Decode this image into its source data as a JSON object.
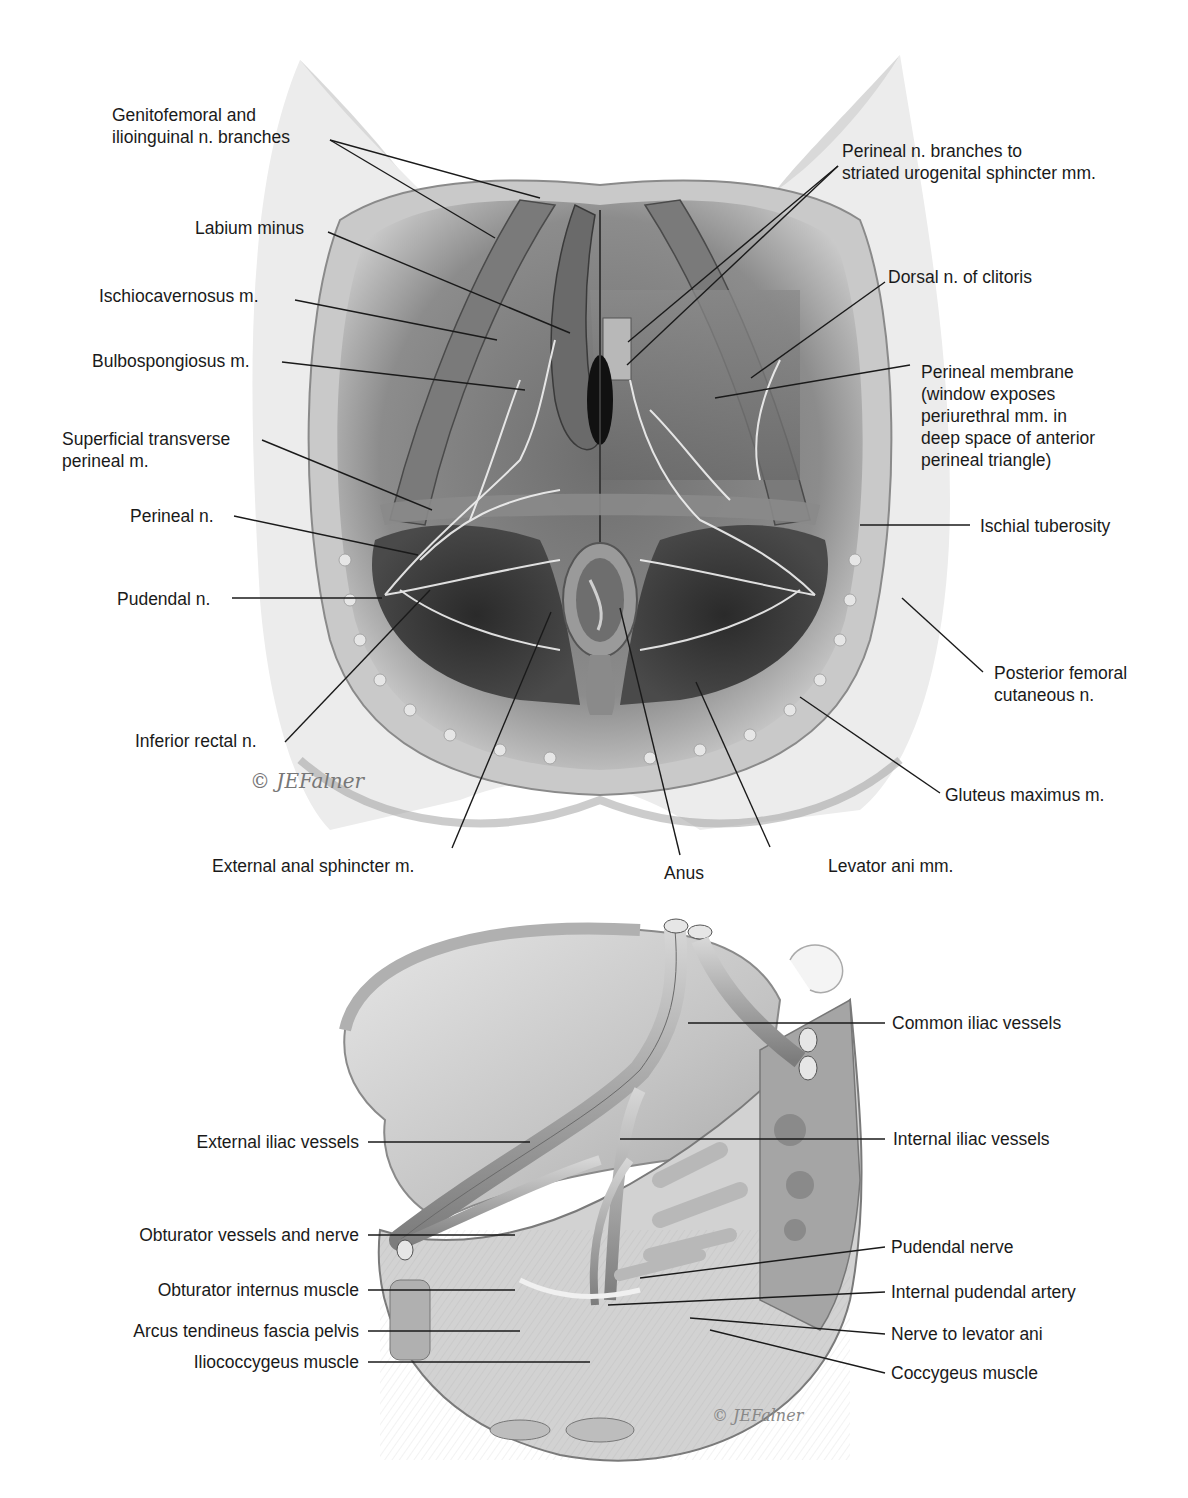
{
  "figure_top": {
    "title": "Female perineum — superficial dissection showing pudendal nerve branches",
    "labels_left": [
      {
        "id": "genitofemoral",
        "text": "Genitofemoral and\nilioinguinal n. branches"
      },
      {
        "id": "labium-minus",
        "text": "Labium minus"
      },
      {
        "id": "ischiocavernosus",
        "text": "Ischiocavernosus m."
      },
      {
        "id": "bulbospongiosus",
        "text": "Bulbospongiosus m."
      },
      {
        "id": "superficial-transverse",
        "text": "Superficial transverse\nperineal m."
      },
      {
        "id": "perineal-n",
        "text": "Perineal n."
      },
      {
        "id": "pudendal-n",
        "text": "Pudendal n."
      },
      {
        "id": "inferior-rectal",
        "text": "Inferior rectal n."
      }
    ],
    "labels_right": [
      {
        "id": "perineal-branches",
        "text": "Perineal n. branches to\nstriated urogenital sphincter mm."
      },
      {
        "id": "dorsal-n-clitoris",
        "text": "Dorsal n. of clitoris"
      },
      {
        "id": "perineal-membrane",
        "text": "Perineal membrane\n(window exposes\nperiurethral mm. in\ndeep space of anterior\nperineal triangle)"
      },
      {
        "id": "ischial-tuberosity",
        "text": "Ischial tuberosity"
      },
      {
        "id": "posterior-femoral",
        "text": "Posterior femoral\ncutaneous n."
      },
      {
        "id": "gluteus-maximus",
        "text": "Gluteus maximus m."
      }
    ],
    "labels_bottom": [
      {
        "id": "external-anal-sphincter",
        "text": "External anal sphincter m."
      },
      {
        "id": "anus",
        "text": "Anus"
      },
      {
        "id": "levator-ani",
        "text": "Levator ani mm."
      }
    ],
    "signature": "© JEFalner"
  },
  "figure_bottom": {
    "title": "Pelvic sidewall — medial view of iliac vessels and pudendal nerve",
    "labels_left": [
      {
        "id": "external-iliac",
        "text": "External iliac vessels"
      },
      {
        "id": "obturator-vessels",
        "text": "Obturator vessels and nerve"
      },
      {
        "id": "obturator-internus",
        "text": "Obturator internus muscle"
      },
      {
        "id": "arcus-tendineus",
        "text": "Arcus tendineus fascia pelvis"
      },
      {
        "id": "iliococcygeus",
        "text": "Iliococcygeus muscle"
      }
    ],
    "labels_right": [
      {
        "id": "common-iliac",
        "text": "Common iliac vessels"
      },
      {
        "id": "internal-iliac",
        "text": "Internal iliac vessels"
      },
      {
        "id": "pudendal-nerve",
        "text": "Pudendal nerve"
      },
      {
        "id": "internal-pudendal-artery",
        "text": "Internal pudendal artery"
      },
      {
        "id": "nerve-levator-ani",
        "text": "Nerve to levator ani"
      },
      {
        "id": "coccygeus",
        "text": "Coccygeus muscle"
      }
    ],
    "signature": "© JEFalner"
  },
  "colors": {
    "background": "#ffffff",
    "ink": "#1a1a1a",
    "tissue_light": "#d8d8d8",
    "tissue_mid": "#9a9a9a",
    "tissue_dark": "#3a3a3a",
    "nerve": "#f2f2f2"
  }
}
